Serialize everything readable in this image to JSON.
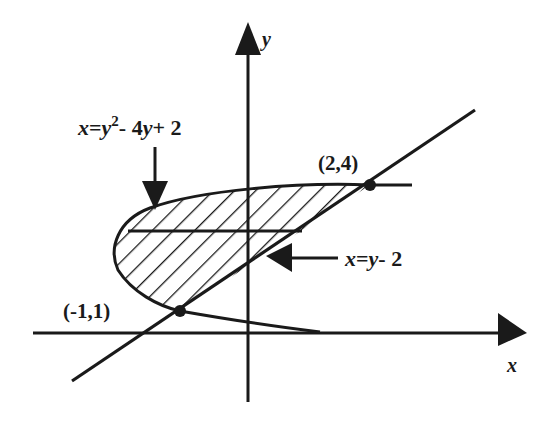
{
  "diagram": {
    "axes": {
      "x_label": "x",
      "y_label": "y"
    },
    "curves": [
      {
        "id": "parabola",
        "equation": "x=y²-4y+2",
        "label_parts": [
          "x",
          "=",
          "y",
          "2",
          "- 4",
          "y",
          "+ 2"
        ]
      },
      {
        "id": "line",
        "equation": "x=y-2",
        "label_parts": [
          "x",
          "=",
          "y",
          "- 2"
        ]
      }
    ],
    "points": [
      {
        "label": "(2,4)",
        "x": 2,
        "y": 4
      },
      {
        "label": "(-1,1)",
        "x": -1,
        "y": 1
      }
    ],
    "region": {
      "description": "shaded region bounded by parabola and line between y=1 and y=4",
      "fill": "diagonal hatching"
    },
    "colors": {
      "ink": "#1a1a1a",
      "background": "#ffffff"
    }
  }
}
